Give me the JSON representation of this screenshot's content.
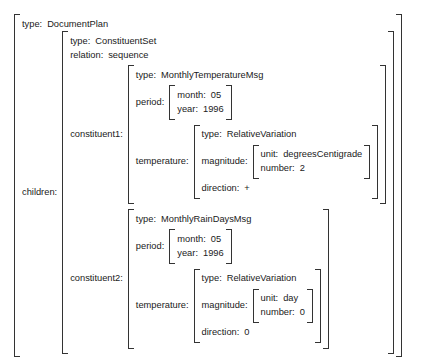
{
  "figure": {
    "kind": "attribute-value-matrix",
    "root": {
      "type_attr": "type:",
      "type_value": "DocumentPlan",
      "children_attr": "children:"
    },
    "constituent_set": {
      "type_attr": "type:",
      "type_value": "ConstituentSet",
      "relation_attr": "relation:",
      "relation_value": "sequence",
      "constituent1_attr": "constituent1:",
      "constituent2_attr": "constituent2:"
    },
    "constituent1": {
      "type_attr": "type:",
      "type_value": "MonthlyTemperatureMsg",
      "period_attr": "period:",
      "period": {
        "month_attr": "month:",
        "month_value": "05",
        "year_attr": "year:",
        "year_value": "1996"
      },
      "temperature_attr": "temperature:",
      "temperature": {
        "type_attr": "type:",
        "type_value": "RelativeVariation",
        "magnitude_attr": "magnitude:",
        "magnitude": {
          "unit_attr": "unit:",
          "unit_value": "degreesCentigrade",
          "number_attr": "number:",
          "number_value": "2"
        },
        "direction_attr": "direction:",
        "direction_value": "+"
      }
    },
    "constituent2": {
      "type_attr": "type:",
      "type_value": "MonthlyRainDaysMsg",
      "period_attr": "period:",
      "period": {
        "month_attr": "month:",
        "month_value": "05",
        "year_attr": "year:",
        "year_value": "1996"
      },
      "temperature_attr": "temperature:",
      "temperature": {
        "type_attr": "type:",
        "type_value": "RelativeVariation",
        "magnitude_attr": "magnitude:",
        "magnitude": {
          "unit_attr": "unit:",
          "unit_value": "day",
          "number_attr": "number:",
          "number_value": "0"
        },
        "direction_attr": "direction:",
        "direction_value": "0"
      }
    }
  },
  "colors": {
    "ink": "#1a1a1a",
    "bracket": "#333333",
    "background": "#ffffff"
  }
}
